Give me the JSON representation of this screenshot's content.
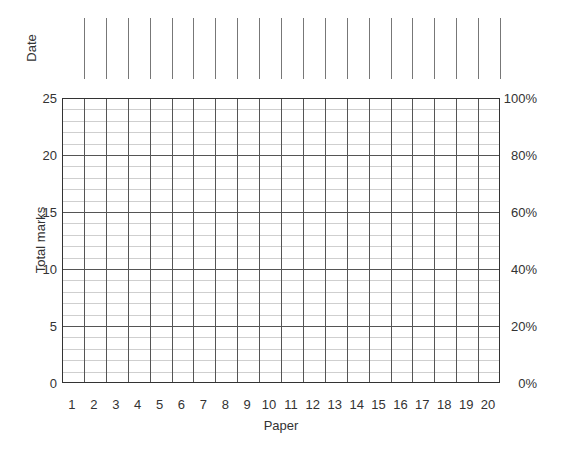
{
  "chart_data": {
    "type": "line",
    "title": "",
    "xlabel": "Paper",
    "ylabel": "Total marks",
    "y2label": "",
    "top_row_label": "Date",
    "x": [
      1,
      2,
      3,
      4,
      5,
      6,
      7,
      8,
      9,
      10,
      11,
      12,
      13,
      14,
      15,
      16,
      17,
      18,
      19,
      20
    ],
    "categories": [
      "1",
      "2",
      "3",
      "4",
      "5",
      "6",
      "7",
      "8",
      "9",
      "10",
      "11",
      "12",
      "13",
      "14",
      "15",
      "16",
      "17",
      "18",
      "19",
      "20"
    ],
    "series": [],
    "ylim": [
      0,
      25
    ],
    "y_ticks": [
      "0",
      "5",
      "10",
      "15",
      "20",
      "25"
    ],
    "y2lim": [
      0,
      100
    ],
    "y2_ticks": [
      "0%",
      "20%",
      "40%",
      "60%",
      "80%",
      "100%"
    ],
    "grid": true,
    "minor_grid_step": 1,
    "major_grid_step": 5
  },
  "labels": {
    "date": "Date",
    "ylabel": "Total marks",
    "xlabel": "Paper"
  }
}
